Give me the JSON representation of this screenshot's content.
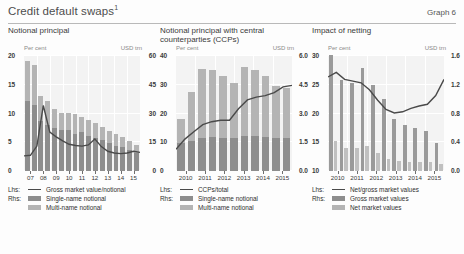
{
  "header": {
    "title": "Credit default swaps",
    "title_footnote": "1",
    "graph_label": "Graph 6"
  },
  "chart_data": [
    {
      "type": "bar",
      "id": "notional-principal",
      "title": "Notional principal",
      "xlabel": "",
      "ylabel": "Per cent",
      "y2label": "USD trn",
      "left_unit": "Per cent",
      "right_unit": "USD trn",
      "ylim": [
        0,
        20
      ],
      "y2lim": [
        0,
        60
      ],
      "left_ticks": [
        "0",
        "5",
        "10",
        "15",
        "20"
      ],
      "right_ticks": [
        "0",
        "15",
        "30",
        "45",
        "60"
      ],
      "grid": true,
      "legend_position": "below",
      "categories": [
        "07H1",
        "07H2",
        "08H1",
        "08H2",
        "09H1",
        "09H2",
        "10H1",
        "10H2",
        "11H1",
        "11H2",
        "12H1",
        "12H2",
        "13H1",
        "13H2",
        "14H1",
        "14H2",
        "15H1"
      ],
      "tick_labels": [
        "07",
        "08",
        "09",
        "10",
        "11",
        "12",
        "13",
        "14",
        "15"
      ],
      "series": [
        {
          "name": "Multi-name notional",
          "axis": "right",
          "kind": "bar-stack-bottom",
          "color": "#8d8d8d",
          "values": [
            36.0,
            34.0,
            26.0,
            24.0,
            22.0,
            21.0,
            21.0,
            19.0,
            20.0,
            18.0,
            17.0,
            16.0,
            14.5,
            13.0,
            12.5,
            11.0,
            9.5
          ]
        },
        {
          "name": "Single-name notional",
          "axis": "right",
          "kind": "bar-stack-top",
          "color": "#b4b4b4",
          "values": [
            21.0,
            21.0,
            13.0,
            12.0,
            10.0,
            9.0,
            9.0,
            10.5,
            8.0,
            8.5,
            8.0,
            7.0,
            6.0,
            6.0,
            5.0,
            4.5,
            4.0
          ]
        },
        {
          "name": "Gross market value/notional",
          "axis": "left",
          "kind": "line",
          "color": "#4a4a4a",
          "values": [
            2.6,
            2.7,
            4.3,
            11.3,
            6.7,
            5.9,
            5.2,
            4.6,
            4.4,
            4.3,
            4.5,
            5.5,
            4.2,
            3.4,
            3.1,
            3.0,
            3.1,
            3.4,
            3.2
          ]
        }
      ]
    },
    {
      "type": "bar",
      "id": "notional-principal-ccp",
      "title": "Notional principal with central counterparties (CCPs)",
      "xlabel": "",
      "ylabel": "Per cent",
      "y2label": "USD trn",
      "left_unit": "Per cent",
      "right_unit": "USD trn",
      "ylim": [
        0,
        40
      ],
      "y2lim": [
        0,
        6.0
      ],
      "left_ticks": [
        "0",
        "10",
        "20",
        "30",
        "40"
      ],
      "right_ticks": [
        "0.0",
        "1.5",
        "3.0",
        "4.5",
        "6.0"
      ],
      "grid": true,
      "legend_position": "below",
      "categories": [
        "2010H1",
        "2010H2",
        "2011H1",
        "2011H2",
        "2012H1",
        "2012H2",
        "2013H1",
        "2013H2",
        "2014H1",
        "2014H2",
        "2015H1"
      ],
      "tick_labels": [
        "2010",
        "2011",
        "2012",
        "2013",
        "2014",
        "2015"
      ],
      "series": [
        {
          "name": "Multi-name notional",
          "axis": "right",
          "kind": "bar-stack-bottom",
          "color": "#8d8d8d",
          "values": [
            1.45,
            1.55,
            1.7,
            1.75,
            1.7,
            1.7,
            1.8,
            1.8,
            1.75,
            1.7,
            1.7
          ]
        },
        {
          "name": "Single-name notional",
          "axis": "right",
          "kind": "bar-stack-top",
          "color": "#b4b4b4",
          "values": [
            1.25,
            2.55,
            3.6,
            3.5,
            3.2,
            2.85,
            3.6,
            3.45,
            3.15,
            2.7,
            2.6
          ]
        },
        {
          "name": "CCPs/total",
          "axis": "left",
          "kind": "line",
          "color": "#4a4a4a",
          "values": [
            7.5,
            11.0,
            13.5,
            16.0,
            17.0,
            17.5,
            17.5,
            21.5,
            24.5,
            25.5,
            26.0,
            27.0,
            29.0,
            29.5
          ]
        }
      ]
    },
    {
      "type": "bar",
      "id": "impact-of-netting",
      "title": "Impact of netting",
      "xlabel": "",
      "ylabel": "Per cent",
      "y2label": "USD trn",
      "left_unit": "Per cent",
      "right_unit": "USD trn",
      "ylim": [
        10,
        30
      ],
      "y2lim": [
        0.0,
        1.6
      ],
      "left_ticks": [
        "10",
        "15",
        "20",
        "25",
        "30"
      ],
      "right_ticks": [
        "0.0",
        "0.4",
        "0.8",
        "1.2",
        "1.6"
      ],
      "grid": true,
      "legend_position": "below",
      "categories": [
        "2010H1",
        "2010H2",
        "2011H1",
        "2011H2",
        "2012H1",
        "2012H2",
        "2013H1",
        "2013H2",
        "2014H1",
        "2014H2",
        "2015H1"
      ],
      "tick_labels": [
        "2010",
        "2011",
        "2012",
        "2013",
        "2014",
        "2015"
      ],
      "series": [
        {
          "name": "Gross market values",
          "axis": "right",
          "kind": "bar-gross",
          "color": "#9a9a9a",
          "values": [
            1.6,
            1.25,
            1.22,
            1.42,
            1.18,
            1.0,
            0.72,
            0.64,
            0.6,
            0.55,
            0.38
          ]
        },
        {
          "name": "Net market values",
          "axis": "right",
          "kind": "bar-net",
          "color": "#c0c0c0",
          "values": [
            0.42,
            0.32,
            0.32,
            0.34,
            0.25,
            0.17,
            0.14,
            0.13,
            0.12,
            0.12,
            0.1
          ]
        },
        {
          "name": "Net/gross market values",
          "axis": "left",
          "kind": "line",
          "color": "#4a4a4a",
          "values": [
            26.2,
            27.0,
            25.8,
            25.5,
            25.2,
            24.0,
            22.2,
            20.6,
            20.0,
            20.2,
            20.8,
            21.2,
            21.5,
            23.0,
            25.8
          ]
        }
      ]
    }
  ],
  "panels": [
    {
      "legend_rows": [
        {
          "key": "Lhs:",
          "swatch": "line",
          "label": "Gross market value/notional"
        },
        {
          "key": "Rhs:",
          "swatch": "dark",
          "label": "Single-name notional"
        },
        {
          "key": "",
          "swatch": "light",
          "label": "Multi-name notional"
        }
      ]
    },
    {
      "legend_rows": [
        {
          "key": "Lhs:",
          "swatch": "line",
          "label": "CCPs/total"
        },
        {
          "key": "Rhs:",
          "swatch": "dark",
          "label": "Single-name notional"
        },
        {
          "key": "",
          "swatch": "light",
          "label": "Multi-name notional"
        }
      ]
    },
    {
      "legend_rows": [
        {
          "key": "Lhs:",
          "swatch": "line",
          "label": "Net/gross market values"
        },
        {
          "key": "Rhs:",
          "swatch": "dark",
          "label": "Gross market values"
        },
        {
          "key": "",
          "swatch": "light",
          "label": "Net market values"
        }
      ]
    }
  ],
  "colors": {
    "bar_dark": "#8d8d8d",
    "bar_light": "#b4b4b4",
    "line": "#4a4a4a",
    "plot_bg": "#f3f3f3",
    "grid": "#ffffff"
  }
}
